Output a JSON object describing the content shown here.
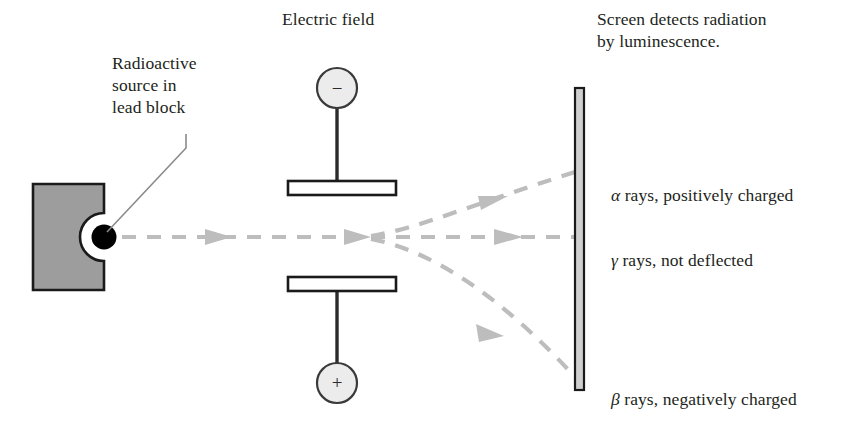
{
  "diagram": {
    "title_electric_field": "Electric field",
    "source_label": "Radioactive\nsource in\nlead block",
    "screen_label": "Screen detects radiation\nby luminescence.",
    "electrodes": {
      "negative_sign": "−",
      "positive_sign": "+"
    },
    "rays": [
      {
        "id": "alpha",
        "greek": "α",
        "text": " rays, positively charged",
        "color": "#b8b8b8"
      },
      {
        "id": "gamma",
        "greek": "γ",
        "text": " rays, not deflected",
        "color": "#b8b8b8"
      },
      {
        "id": "beta",
        "greek": "β",
        "text": " rays, negatively charged",
        "color": "#b8b8b8"
      }
    ],
    "colors": {
      "text": "#231f20",
      "lead_block_fill": "#9d9d9d",
      "lead_block_stroke": "#1a1a1a",
      "source_dot": "#000000",
      "plate_fill": "#ffffff",
      "plate_stroke": "#1a1a1a",
      "terminal_fill": "#ececec",
      "terminal_stroke": "#3a3a3a",
      "ray": "#bdbdbd",
      "screen_fill": "#cfcfcf",
      "screen_stroke": "#1a1a1a",
      "leader_line": "#8a8a8a"
    }
  }
}
